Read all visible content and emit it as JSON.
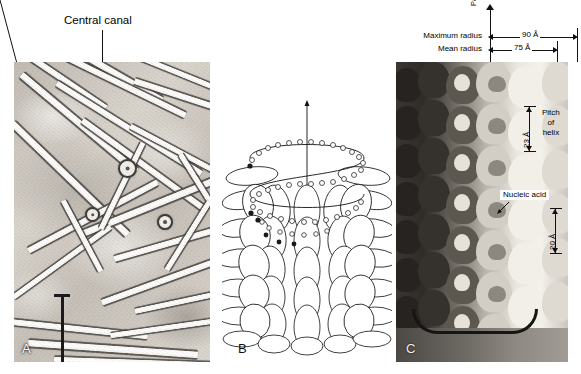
{
  "figure": {
    "panels": [
      "A",
      "B",
      "C"
    ]
  },
  "panel_a": {
    "letter": "A",
    "annotation_label": "Central canal",
    "type": "electron-micrograph",
    "scale_bar": {
      "present": true,
      "style": "i-beam"
    }
  },
  "panel_b": {
    "letter": "B",
    "type": "line-drawing",
    "description": "helical arrangement of protein subunits with RNA coil"
  },
  "panel_c": {
    "letter": "C",
    "type": "model-photograph",
    "axis_label": "Particle axis",
    "dimensions": [
      {
        "name": "Maximum radius",
        "value": "90 Å"
      },
      {
        "name": "Mean radius",
        "value": "75 Å"
      }
    ],
    "pitch_label": {
      "line1": "Pitch",
      "line2": "of",
      "line3": "helix"
    },
    "pitch_value": "23 Å",
    "rise_value": "20 Å",
    "nucleic_acid_label": "Nucleic acid"
  },
  "colors": {
    "ink": "#111111",
    "paper": "#ffffff",
    "micrograph_base": "#cfcac3",
    "model_light": "#f4f2ec",
    "model_dark": "#2e2b28"
  }
}
